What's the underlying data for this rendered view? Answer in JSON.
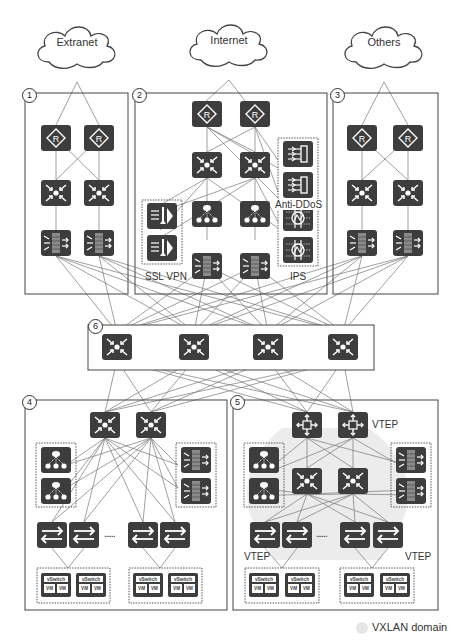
{
  "clouds": [
    {
      "id": "extranet",
      "label": "Extranet"
    },
    {
      "id": "internet",
      "label": "Internet"
    },
    {
      "id": "others",
      "label": "Others"
    }
  ],
  "zones": [
    {
      "number": "1",
      "role": "extranet access zone"
    },
    {
      "number": "2",
      "role": "internet access zone"
    },
    {
      "number": "3",
      "role": "other access zone"
    },
    {
      "number": "4",
      "role": "traditional server zone"
    },
    {
      "number": "5",
      "role": "VXLAN server zone"
    },
    {
      "number": "6",
      "role": "core zone"
    }
  ],
  "labels": {
    "anti_ddos": "Anti-DDoS",
    "ssl_vpn": "SSL VPN",
    "ips": "IPS",
    "vtep_spine": "VTEP",
    "vtep_left": "VTEP",
    "vtep_right": "VTEP",
    "ellipsis_left": "......",
    "ellipsis_right": "......"
  },
  "vswitch": {
    "label": "vSwitch",
    "vm": "VM"
  },
  "legend": {
    "label": "VXLAN domain",
    "swatch_color": "#e8e8e8"
  },
  "colors": {
    "icon_fill": "#3d3d3d",
    "line": "#666666",
    "border": "#444444",
    "vxlan_area": "#ececec"
  }
}
